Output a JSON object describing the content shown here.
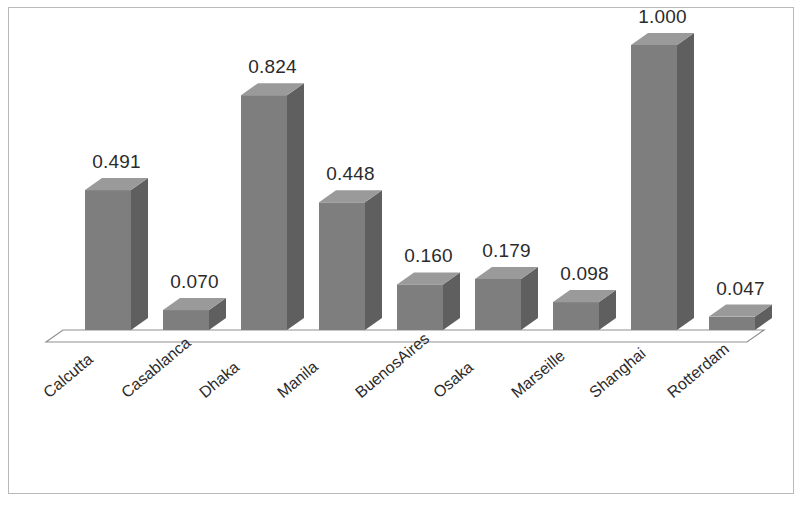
{
  "figure": {
    "border_color": "#b9b9b9",
    "background": "#ffffff",
    "bar_color": "#7e7e7e",
    "bar_top_color": "#9a9a9a",
    "bar_side_color": "#5f5f5f",
    "floor_line_color": "#8f8f8f",
    "label_color": "#2b2b2b"
  },
  "chart_data": {
    "type": "bar",
    "title": "",
    "subtitle": "",
    "xlabel": "",
    "ylabel": "",
    "grid": false,
    "legend": false,
    "legend_position": "none",
    "three_d": true,
    "axis_visible": false,
    "ylim": [
      0,
      1.0
    ],
    "value_format": "0.000",
    "categories": [
      "Calcutta",
      "Casablanca",
      "Dhaka",
      "Manila",
      "BuenosAires",
      "Osaka",
      "Marseille",
      "Shanghai",
      "Rotterdam"
    ],
    "values": [
      0.491,
      0.07,
      0.824,
      0.448,
      0.16,
      0.179,
      0.098,
      1.0,
      0.047
    ],
    "value_labels": [
      "0.491",
      "0.070",
      "0.824",
      "0.448",
      "0.160",
      "0.179",
      "0.098",
      "1.000",
      "0.047"
    ]
  }
}
